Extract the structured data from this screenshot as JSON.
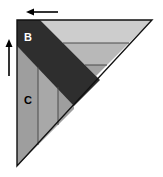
{
  "figure": {
    "canvas": {
      "width": 163,
      "height": 177,
      "background": "#ffffff"
    },
    "labels": {
      "b": "B",
      "c": "C"
    },
    "label_positions": {
      "b": {
        "x": 24,
        "y": 37
      },
      "c": {
        "x": 29,
        "y": 100
      }
    },
    "colors": {
      "outline": "#000000",
      "dark_band": "#2e2e2e",
      "mid_gray": "#9a9a9a",
      "light_gray": "#c9c9c9",
      "lighter_gray": "#bdbdbd",
      "pale_gray": "#d5d5d5",
      "band_gray": "#a8a8a8",
      "arrow": "#000000",
      "background": "#ffffff",
      "label_text": "#000000"
    },
    "geometry": {
      "triangle_top_left": {
        "x": 17,
        "y": 20
      },
      "triangle_top_right": {
        "x": 152,
        "y": 20
      },
      "triangle_bottom_left": {
        "x": 17,
        "y": 166
      }
    },
    "arrows": [
      {
        "name": "top-arrow",
        "direction": "left",
        "from": {
          "x": 57,
          "y": 12
        },
        "to": {
          "x": 27,
          "y": 12
        }
      },
      {
        "name": "left-arrow",
        "direction": "up",
        "from": {
          "x": 9,
          "y": 75
        },
        "to": {
          "x": 9,
          "y": 40
        }
      }
    ],
    "regions": [
      {
        "name": "dark-fold-band",
        "fill": "#2e2e2e"
      },
      {
        "name": "region-c-panel-1",
        "fill": "#9a9a9a"
      },
      {
        "name": "region-c-panel-2",
        "fill": "#a8a8a8"
      },
      {
        "name": "region-c-panel-3",
        "fill": "#9a9a9a"
      },
      {
        "name": "upper-band-1",
        "fill": "#c9c9c9"
      },
      {
        "name": "upper-band-2",
        "fill": "#bdbdbd"
      },
      {
        "name": "upper-band-3",
        "fill": "#a8a8a8"
      }
    ]
  }
}
